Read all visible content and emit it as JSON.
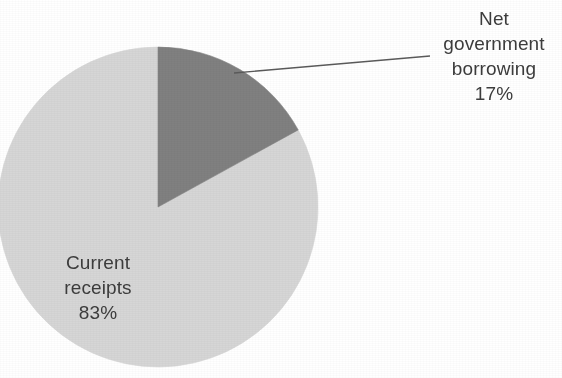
{
  "figure": {
    "background_color": "#ffffff",
    "text_color": "#3c3c3c",
    "leader_line_color": "#5a5a5a"
  },
  "labels": {
    "net_government_borrowing": {
      "line1": "Net",
      "line2": "government",
      "line3": "borrowing",
      "line4": "17%"
    },
    "current_receipts": {
      "line1": "Current",
      "line2": "receipts",
      "line3": "83%"
    }
  },
  "chart_data": {
    "type": "pie",
    "title": "",
    "subtitle": "",
    "xlabel": "",
    "ylabel": "",
    "grid": false,
    "legend": "none",
    "labels_position": "outside-and-inside",
    "start_angle_deg": 0,
    "direction": "clockwise",
    "total": 100,
    "units": "%",
    "categories": [
      "Net government borrowing",
      "Current receipts"
    ],
    "values": [
      17,
      83
    ],
    "value_labels": [
      "17%",
      "83%"
    ],
    "colors": [
      "#808080",
      "#d6d6d6"
    ],
    "slices": [
      {
        "name": "Net government borrowing",
        "value": 17,
        "value_label": "17%",
        "color": "#808080",
        "start_angle_deg": 0,
        "end_angle_deg": 61.2,
        "label_placement": "outside",
        "has_leader_line": true
      },
      {
        "name": "Current receipts",
        "value": 83,
        "value_label": "83%",
        "color": "#d6d6d6",
        "start_angle_deg": 61.2,
        "end_angle_deg": 360,
        "label_placement": "inside",
        "has_leader_line": false
      }
    ]
  }
}
